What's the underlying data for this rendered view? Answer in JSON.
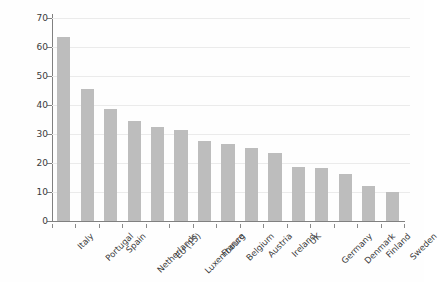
{
  "chart_data": {
    "type": "bar",
    "title": "",
    "xlabel": "",
    "ylabel": "percentage",
    "ylim": [
      0,
      70
    ],
    "yticks": [
      0,
      10,
      20,
      30,
      40,
      50,
      60,
      70
    ],
    "grid": true,
    "legend": "none",
    "bar_color": "#bdbdbd",
    "categories": [
      "Italy",
      "Portugal",
      "Spain",
      "Netherlands",
      "EU (15)",
      "Luxembourg",
      "France",
      "Belgium",
      "Austria",
      "Ireland",
      "UK",
      "Germany",
      "Denmark",
      "Finland",
      "Sweden"
    ],
    "values": [
      63.5,
      45.6,
      38.7,
      34.5,
      32.5,
      31.5,
      27.5,
      26.5,
      25.3,
      23.4,
      18.5,
      18.4,
      16.1,
      12.2,
      10.0
    ]
  }
}
